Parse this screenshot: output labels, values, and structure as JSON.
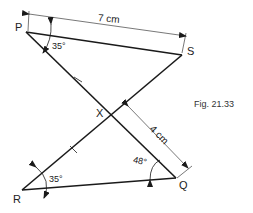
{
  "figure": {
    "caption": "Fig. 21.33",
    "points": {
      "P": "P",
      "S": "S",
      "X": "X",
      "R": "R",
      "Q": "Q"
    },
    "angles": {
      "at_P": "35°",
      "at_R": "35°",
      "at_Q": "48°"
    },
    "dimensions": {
      "PS": "7 cm",
      "XS": "4 cm"
    },
    "colors": {
      "line": "#1a1a1a",
      "dimension": "#555555"
    }
  }
}
